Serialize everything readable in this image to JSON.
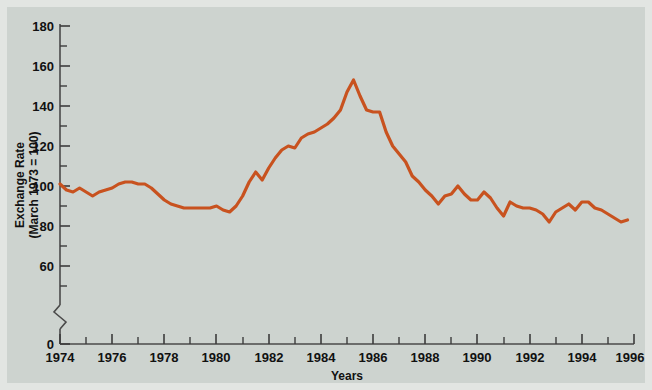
{
  "figure": {
    "background_color": "#cdd3cf",
    "frame_color": "#e2e5e2"
  },
  "axis": {
    "y_title_line1": "Exchange Rate",
    "y_title_line2": "(March 1973 = 100)",
    "x_title": "Years",
    "y_tick_labels": [
      "180",
      "160",
      "140",
      "120",
      "100",
      "80",
      "60",
      "0"
    ],
    "x_tick_labels": [
      "1974",
      "1976",
      "1978",
      "1980",
      "1982",
      "1984",
      "1986",
      "1988",
      "1990",
      "1992",
      "1994",
      "1996"
    ],
    "axis_break": "zigzag between 0 and 60"
  },
  "chart_data": {
    "type": "line",
    "title": "",
    "subtitle": "",
    "xlabel": "Years",
    "ylabel": "Exchange Rate (March 1973 = 100)",
    "xlim": [
      1974,
      1996
    ],
    "ylim": [
      60,
      180
    ],
    "y_axis_broken_below": 60,
    "grid": false,
    "legend": null,
    "line_color": "#c8521f",
    "x_major_ticks": [
      1974,
      1976,
      1978,
      1980,
      1982,
      1984,
      1986,
      1988,
      1990,
      1992,
      1994,
      1996
    ],
    "x_minor_ticks": [
      1975,
      1977,
      1979,
      1981,
      1983,
      1985,
      1987,
      1989,
      1991,
      1993,
      1995
    ],
    "y_major_ticks": [
      60,
      80,
      100,
      120,
      140,
      160,
      180
    ],
    "y_minor_ticks": [
      70,
      90,
      110,
      130,
      150,
      170
    ],
    "series": [
      {
        "name": "Trade-weighted U.S. dollar exchange rate",
        "x": [
          1974.0,
          1974.25,
          1974.5,
          1974.75,
          1975.0,
          1975.25,
          1975.5,
          1975.75,
          1976.0,
          1976.25,
          1976.5,
          1976.75,
          1977.0,
          1977.25,
          1977.5,
          1977.75,
          1978.0,
          1978.25,
          1978.5,
          1978.75,
          1979.0,
          1979.25,
          1979.5,
          1979.75,
          1980.0,
          1980.25,
          1980.5,
          1980.75,
          1981.0,
          1981.25,
          1981.5,
          1981.75,
          1982.0,
          1982.25,
          1982.5,
          1982.75,
          1983.0,
          1983.25,
          1983.5,
          1983.75,
          1984.0,
          1984.25,
          1984.5,
          1984.75,
          1985.0,
          1985.25,
          1985.5,
          1985.75,
          1986.0,
          1986.25,
          1986.5,
          1986.75,
          1987.0,
          1987.25,
          1987.5,
          1987.75,
          1988.0,
          1988.25,
          1988.5,
          1988.75,
          1989.0,
          1989.25,
          1989.5,
          1989.75,
          1990.0,
          1990.25,
          1990.5,
          1990.75,
          1991.0,
          1991.25,
          1991.5,
          1991.75,
          1992.0,
          1992.25,
          1992.5,
          1992.75,
          1993.0,
          1993.25,
          1993.5,
          1993.75,
          1994.0,
          1994.25,
          1994.5,
          1994.75,
          1995.0,
          1995.25,
          1995.5,
          1995.75
        ],
        "values": [
          101,
          98,
          97,
          99,
          97,
          95,
          97,
          98,
          99,
          101,
          102,
          102,
          101,
          101,
          99,
          96,
          93,
          91,
          90,
          89,
          89,
          89,
          89,
          89,
          90,
          88,
          87,
          90,
          95,
          102,
          107,
          103,
          109,
          114,
          118,
          120,
          119,
          124,
          126,
          127,
          129,
          131,
          134,
          138,
          147,
          153,
          145,
          138,
          137,
          137,
          127,
          120,
          116,
          112,
          105,
          102,
          98,
          95,
          91,
          95,
          96,
          100,
          96,
          93,
          93,
          97,
          94,
          89,
          85,
          92,
          90,
          89,
          89,
          88,
          86,
          82,
          87,
          89,
          91,
          88,
          92,
          92,
          89,
          88,
          86,
          84,
          82,
          83
        ]
      }
    ]
  }
}
